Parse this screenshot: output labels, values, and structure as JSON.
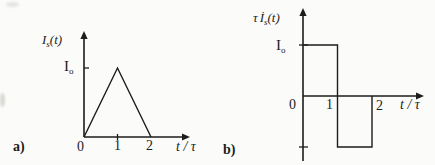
{
  "figure": {
    "background": "#fbfbf9",
    "ink": "#1c1c1c"
  },
  "plot_a": {
    "caption": "a)",
    "ylabel": {
      "base": "I",
      "sub": "s",
      "args": "(t)"
    },
    "ytick_label": {
      "base": "I",
      "sub": "o"
    },
    "xtick_labels": [
      "0",
      "1",
      "2"
    ],
    "xlabel": "t / τ"
  },
  "plot_b": {
    "caption": "b)",
    "ylabel": {
      "tau": "τ",
      "base": "İ",
      "sub": "s",
      "args": "(t)"
    },
    "ytick_label": {
      "base": "I",
      "sub": "o"
    },
    "xtick_labels": [
      "0",
      "1",
      "2"
    ],
    "xlabel": "t / τ"
  },
  "chart_data": [
    {
      "id": "a",
      "type": "line",
      "xlabel": "t / τ",
      "ylabel": "I_s(t)",
      "y_units": "I_o",
      "series": [
        {
          "name": "I_s(t)",
          "points": [
            [
              0,
              0
            ],
            [
              1,
              1
            ],
            [
              2,
              0
            ]
          ]
        }
      ],
      "xticks": [
        0,
        1,
        2
      ],
      "yticks": [
        {
          "value": 1,
          "label": "I_o"
        }
      ],
      "xlim": [
        0,
        3.2
      ],
      "ylim": [
        0,
        1.55
      ],
      "grid": false,
      "legend": false
    },
    {
      "id": "b",
      "type": "line",
      "xlabel": "t / τ",
      "ylabel": "τ İ_s(t)",
      "y_units": "I_o",
      "series": [
        {
          "name": "τ İ_s(t)",
          "points": [
            [
              0,
              1
            ],
            [
              1,
              1
            ],
            [
              1,
              -1
            ],
            [
              2,
              -1
            ],
            [
              2,
              0
            ]
          ]
        }
      ],
      "xticks": [
        0,
        1,
        2
      ],
      "yticks": [
        {
          "value": 1,
          "label": "I_o"
        },
        {
          "value": -1,
          "label": ""
        }
      ],
      "xlim": [
        0,
        3.5
      ],
      "ylim": [
        -1.3,
        1.7
      ],
      "grid": false,
      "legend": false
    }
  ]
}
